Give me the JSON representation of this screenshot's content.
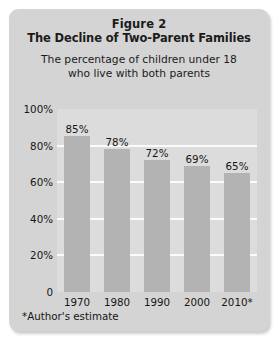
{
  "card": {
    "figure_number": "Figure 2",
    "title": "The Decline of Two-Parent Families",
    "subtitle_line_1": "The percentage of children under 18",
    "subtitle_line_2": "who live with both parents",
    "footnote": "*Author's estimate",
    "background_color": "#d4d4d4",
    "plot_background_color": "#dcdcdc",
    "bar_color": "#b3b3b3",
    "gridline_color": "#fbfbfb",
    "text_color": "#161616"
  },
  "chart_data": {
    "type": "bar",
    "title": "The Decline of Two-Parent Families",
    "subtitle": "The percentage of children under 18 who live with both parents",
    "categories": [
      "1970",
      "1980",
      "1990",
      "2000",
      "2010*"
    ],
    "values": [
      85,
      78,
      72,
      69,
      65
    ],
    "data_labels": [
      "85%",
      "78%",
      "72%",
      "69%",
      "65%"
    ],
    "xlabel": "",
    "ylabel": "",
    "ylim": [
      0,
      100
    ],
    "ytick_values": [
      100,
      80,
      60,
      40,
      20,
      0
    ],
    "ytick_labels": [
      "100%",
      "80%",
      "60%",
      "40%",
      "20%",
      "0"
    ],
    "grid": true,
    "grid_axis": "y",
    "legend": false,
    "annotations": [
      "*Author's estimate"
    ]
  }
}
